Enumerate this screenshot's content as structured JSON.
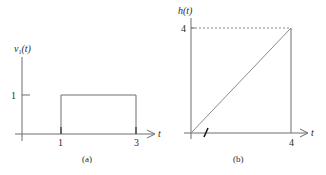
{
  "panel_a": {
    "y_label": "v",
    "y_label_sub": "1",
    "y_label_arg": "(t)",
    "x_label": "t",
    "y_tick": "1",
    "x_ticks": [
      "1",
      "3"
    ],
    "caption": "(a)",
    "pulse": {
      "start": 1,
      "end": 3,
      "height": 1
    }
  },
  "panel_b": {
    "y_label": "h(t)",
    "x_label": "t",
    "y_tick": "4",
    "x_tick": "4",
    "caption": "(b)",
    "ramp": {
      "from": [
        0,
        0
      ],
      "to": [
        4,
        4
      ]
    }
  },
  "colors": {
    "line": "#6e6e6e",
    "text": "#2a2a2a",
    "mark": "#111111"
  }
}
